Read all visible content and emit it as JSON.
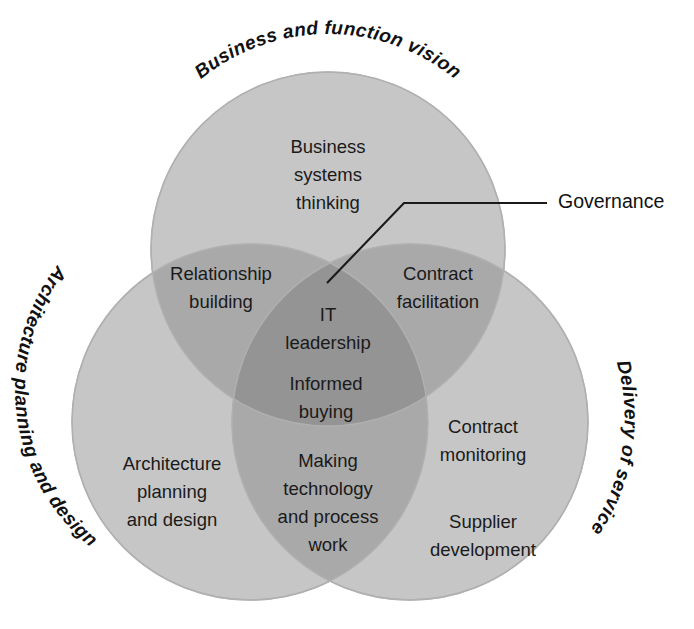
{
  "diagram": {
    "colors": {
      "circle_fill": "#c6c6c6",
      "overlap_two": "#a9a9a9",
      "overlap_three": "#949494",
      "circle_stroke": "#b3b3b3",
      "text": "#1a1a1a",
      "leader_line": "#1a1a1a",
      "background": "#ffffff"
    },
    "circles": [
      {
        "id": "business-and-function-vision",
        "arc_label": "Business and function vision",
        "cx": 328,
        "cy": 249,
        "r": 177
      },
      {
        "id": "architecture-planning-and-design",
        "arc_label": "Architecture planning and design",
        "cx": 250,
        "cy": 422,
        "r": 178
      },
      {
        "id": "delivery-of-service",
        "arc_label": "Delivery of service",
        "cx": 410,
        "cy": 422,
        "r": 178
      }
    ],
    "regions": [
      {
        "id": "business-systems-thinking",
        "membership": [
          "business-and-function-vision"
        ],
        "lines": [
          "Business",
          "systems",
          "thinking"
        ],
        "x": 328,
        "y": 148
      },
      {
        "id": "relationship-building",
        "membership": [
          "business-and-function-vision",
          "architecture-planning-and-design"
        ],
        "lines": [
          "Relationship",
          "building"
        ],
        "x": 221,
        "y": 275
      },
      {
        "id": "contract-facilitation",
        "membership": [
          "business-and-function-vision",
          "delivery-of-service"
        ],
        "lines": [
          "Contract",
          "facilitation"
        ],
        "x": 438,
        "y": 275
      },
      {
        "id": "it-leadership",
        "membership": [
          "business-and-function-vision",
          "architecture-planning-and-design",
          "delivery-of-service"
        ],
        "lines": [
          "IT",
          "leadership"
        ],
        "x": 328,
        "y": 318
      },
      {
        "id": "informed-buying",
        "membership": [
          "business-and-function-vision",
          "architecture-planning-and-design",
          "delivery-of-service"
        ],
        "lines": [
          "Informed",
          "buying"
        ],
        "x": 326,
        "y": 385
      },
      {
        "id": "architecture-planning-and-design-region",
        "membership": [
          "architecture-planning-and-design"
        ],
        "lines": [
          "Architecture",
          "planning",
          "and design"
        ],
        "x": 172,
        "y": 465
      },
      {
        "id": "making-technology-and-process-work",
        "membership": [
          "architecture-planning-and-design",
          "delivery-of-service"
        ],
        "lines": [
          "Making",
          "technology",
          "and process",
          "work"
        ],
        "x": 328,
        "y": 462
      },
      {
        "id": "contract-monitoring",
        "membership": [
          "delivery-of-service"
        ],
        "lines": [
          "Contract",
          "monitoring"
        ],
        "x": 483,
        "y": 428
      },
      {
        "id": "supplier-development",
        "membership": [
          "delivery-of-service"
        ],
        "lines": [
          "Supplier",
          "development"
        ],
        "x": 483,
        "y": 523
      }
    ],
    "callout": {
      "id": "governance",
      "label": "Governance",
      "label_x": 558,
      "label_y": 200,
      "line_points": "327,283 404,203 547,203"
    }
  }
}
